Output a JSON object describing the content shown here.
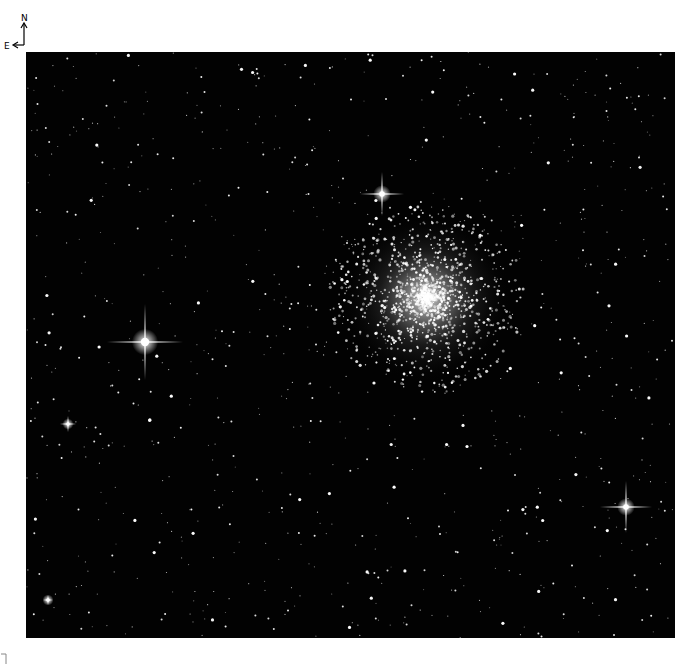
{
  "compass": {
    "north_label": "N",
    "east_label": "E"
  },
  "image": {
    "subject": "globular star cluster in a dense star field",
    "background_color": "#020202",
    "cluster": {
      "cx": 400,
      "cy": 246,
      "core_radius": 30,
      "halo_radius": 85
    },
    "bright_stars": [
      {
        "name": "bright-star-left",
        "x": 119,
        "y": 290,
        "spike": 38,
        "r": 6
      },
      {
        "name": "bright-star-top",
        "x": 356,
        "y": 142,
        "spike": 22,
        "r": 4
      },
      {
        "name": "bright-star-lower-right",
        "x": 600,
        "y": 455,
        "spike": 26,
        "r": 4
      },
      {
        "name": "star-left-mid",
        "x": 42,
        "y": 372,
        "spike": 8,
        "r": 2.5
      },
      {
        "name": "star-bottom-left",
        "x": 22,
        "y": 548,
        "spike": 5,
        "r": 2.5
      }
    ]
  },
  "footer": {
    "corner_mark": "⌐"
  }
}
